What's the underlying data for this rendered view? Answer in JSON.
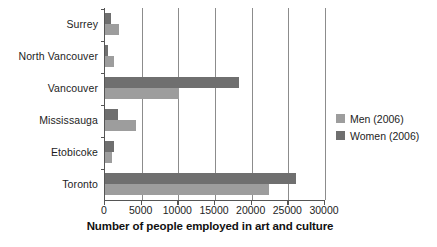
{
  "chart_data": {
    "type": "bar",
    "orientation": "horizontal",
    "title": "",
    "xlabel": "Number of people employed in art and culture",
    "ylabel": "",
    "categories": [
      "Surrey",
      "North Vancouver",
      "Vancouver",
      "Mississauga",
      "Etobicoke",
      "Toronto"
    ],
    "series": [
      {
        "name": "Men (2006)",
        "color": "#9d9d9d",
        "values": [
          1900,
          1250,
          10100,
          4200,
          1000,
          22300
        ]
      },
      {
        "name": "Women (2006)",
        "color": "#6f6f6f",
        "values": [
          750,
          400,
          18300,
          1800,
          1200,
          26100
        ]
      }
    ],
    "xlim": [
      0,
      30000
    ],
    "xticks": [
      0,
      5000,
      10000,
      15000,
      20000,
      25000,
      30000
    ],
    "xtick_labels": [
      "0",
      "5000",
      "10000",
      "15000",
      "20000",
      "25000",
      "30000"
    ],
    "grid": true,
    "grid_axis": "x",
    "legend_position": "right"
  },
  "legend": {
    "items": [
      {
        "label": "Men (2006)",
        "color": "#9d9d9d"
      },
      {
        "label": "Women (2006)",
        "color": "#6f6f6f"
      }
    ]
  },
  "colors": {
    "men": "#9d9d9d",
    "women": "#6f6f6f",
    "axis": "#555555",
    "grid": "#8c8c8c",
    "background": "#ffffff"
  }
}
